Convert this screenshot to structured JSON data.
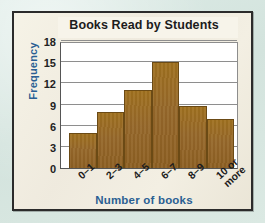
{
  "figure": {
    "outer_background": "#d9e8e3",
    "panel_background": "#f2efe1",
    "border_color": "#2b2b2b",
    "accent_color": "#2a5f93",
    "bar_color": "#96682a",
    "gridline_color": "#8e8e8e"
  },
  "chart_data": {
    "type": "bar",
    "title": "Books Read by Students",
    "xlabel": "Number of books",
    "ylabel": "Frequency",
    "categories": [
      "0–1",
      "2–3",
      "4–5",
      "6–7",
      "8–9",
      "10 or more"
    ],
    "values": [
      5,
      8,
      11,
      15,
      8.8,
      7
    ],
    "ylim": [
      0,
      18
    ],
    "yticks": [
      0,
      3,
      6,
      9,
      12,
      15,
      18
    ],
    "ytick_labels": [
      "0",
      "3",
      "6",
      "9",
      "12",
      "15",
      "18"
    ],
    "grid": true,
    "legend": false,
    "legend_position": "none",
    "style": "histogram, contiguous bars"
  }
}
